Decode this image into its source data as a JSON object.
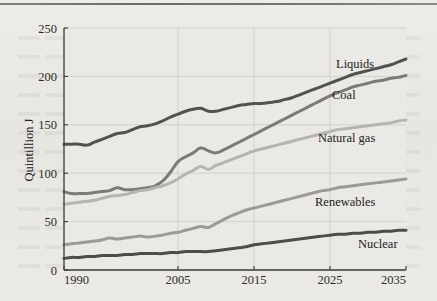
{
  "figure": {
    "background_color": "#e9e8e4",
    "plot_background_color": "#eae9e5",
    "top_rule": "page-rule"
  },
  "chart_data": {
    "type": "line",
    "title": "",
    "subtitle": "",
    "xlabel": "",
    "ylabel": "Quintillion J",
    "xlim": [
      1990,
      2035
    ],
    "ylim": [
      0,
      250
    ],
    "xticks": [
      1990,
      2005,
      2015,
      2025,
      2035
    ],
    "xtick_labels": [
      "1990",
      "2005",
      "2015",
      "2025",
      "2035"
    ],
    "yticks": [
      0,
      50,
      100,
      150,
      200,
      250
    ],
    "ytick_labels": [
      "0",
      "50",
      "100",
      "150",
      "200",
      "250"
    ],
    "grid": true,
    "grid_color": "#c9c7c0",
    "legend_position": "inline-right-of-line-ends",
    "x": [
      1990,
      1991,
      1992,
      1993,
      1994,
      1995,
      1996,
      1997,
      1998,
      1999,
      2000,
      2001,
      2002,
      2003,
      2004,
      2005,
      2006,
      2007,
      2008,
      2009,
      2010,
      2011,
      2012,
      2013,
      2014,
      2015,
      2016,
      2017,
      2018,
      2019,
      2020,
      2021,
      2022,
      2023,
      2024,
      2025,
      2026,
      2027,
      2028,
      2029,
      2030,
      2031,
      2032,
      2033,
      2034,
      2035
    ],
    "series": [
      {
        "name": "Liquids",
        "label": "Liquids",
        "color": "#54524e",
        "linewidth": 3.0,
        "values": [
          130,
          130,
          130,
          129,
          132,
          135,
          138,
          141,
          142,
          145,
          148,
          149,
          151,
          154,
          158,
          161,
          164,
          166,
          167,
          164,
          164,
          166,
          168,
          170,
          171,
          172,
          172,
          173,
          174,
          176,
          178,
          181,
          184,
          187,
          190,
          193,
          196,
          199,
          202,
          204,
          206,
          208,
          210,
          212,
          215,
          218
        ]
      },
      {
        "name": "Coal",
        "label": "Coal",
        "color": "#7b7a75",
        "linewidth": 3.0,
        "values": [
          81,
          79,
          79,
          79,
          80,
          81,
          82,
          85,
          83,
          83,
          84,
          85,
          87,
          92,
          101,
          112,
          117,
          121,
          126,
          123,
          121,
          124,
          128,
          132,
          136,
          140,
          144,
          148,
          152,
          156,
          160,
          164,
          168,
          172,
          176,
          180,
          183,
          186,
          189,
          191,
          193,
          195,
          196,
          198,
          199,
          201
        ]
      },
      {
        "name": "Natural gas",
        "label": "Natural gas",
        "color": "#b6b4ae",
        "linewidth": 3.0,
        "values": [
          68,
          69,
          70,
          71,
          72,
          74,
          76,
          77,
          78,
          80,
          82,
          83,
          85,
          87,
          90,
          94,
          99,
          103,
          107,
          104,
          108,
          111,
          114,
          117,
          120,
          123,
          125,
          127,
          129,
          131,
          133,
          135,
          137,
          139,
          141,
          143,
          145,
          146,
          147,
          148,
          149,
          150,
          151,
          152,
          154,
          155
        ]
      },
      {
        "name": "Renewables",
        "label": "Renewables",
        "color": "#9c9a94",
        "linewidth": 3.0,
        "values": [
          26,
          27,
          28,
          29,
          30,
          31,
          33,
          32,
          33,
          34,
          35,
          34,
          35,
          36,
          38,
          39,
          41,
          43,
          45,
          44,
          48,
          52,
          56,
          59,
          62,
          64,
          66,
          68,
          70,
          72,
          74,
          76,
          78,
          80,
          82,
          83,
          85,
          86,
          87,
          88,
          89,
          90,
          91,
          92,
          93,
          94
        ]
      },
      {
        "name": "Nuclear",
        "label": "Nuclear",
        "color": "#4e4c49",
        "linewidth": 3.0,
        "values": [
          12,
          13,
          13,
          14,
          14,
          15,
          15,
          15,
          16,
          16,
          17,
          17,
          17,
          17,
          18,
          18,
          19,
          19,
          19,
          19,
          20,
          21,
          22,
          23,
          24,
          26,
          27,
          28,
          29,
          30,
          31,
          32,
          33,
          34,
          35,
          36,
          37,
          37,
          38,
          38,
          39,
          39,
          40,
          40,
          41,
          41
        ]
      }
    ],
    "series_label_positions": [
      {
        "name": "Liquids",
        "x": 336,
        "y": 68
      },
      {
        "name": "Coal",
        "x": 332,
        "y": 99
      },
      {
        "name": "Natural gas",
        "x": 318,
        "y": 142
      },
      {
        "name": "Renewables",
        "x": 315,
        "y": 206
      },
      {
        "name": "Nuclear",
        "x": 358,
        "y": 248
      }
    ]
  }
}
